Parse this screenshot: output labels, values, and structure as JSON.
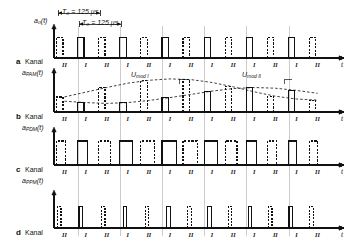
{
  "figure": {
    "time_axis_label": "t",
    "period_labels": [
      {
        "id": "T0",
        "text": "T₀ = 125 μs"
      },
      {
        "id": "T0b",
        "text": "T₀ = 125 μs"
      }
    ],
    "top_signal_label": "a₀(t)",
    "mod_labels": [
      {
        "id": "mod1",
        "text": "U",
        "sub": "mod I"
      },
      {
        "id": "mod2",
        "text": "U",
        "sub": "mod II"
      }
    ],
    "channels": [
      "I",
      "II"
    ],
    "rows": [
      {
        "letter": "a",
        "kanal": "Kanal",
        "signal": "a",
        "signal_sub": "PAM",
        "signal_arg": "(t)",
        "type": "clock",
        "description": "Abtastimpulse Kanal I und II"
      },
      {
        "letter": "b",
        "kanal": "Kanal",
        "signal": "a",
        "signal_sub": "PDM",
        "signal_arg": "(t)",
        "type": "pam",
        "description": "Pulsamplitudenmodulation"
      },
      {
        "letter": "c",
        "kanal": "Kanal",
        "signal": "a",
        "signal_sub": "PPM",
        "signal_arg": "(t)",
        "type": "pdm",
        "description": "Pulsdauermodulation"
      },
      {
        "letter": "d",
        "kanal": "Kanal",
        "signal": "a",
        "signal_sub": "PPM",
        "signal_arg": "(t)",
        "type": "ppm",
        "description": "Pulsphasenmodulation"
      }
    ],
    "channel_marks": [
      "II",
      "I",
      "II",
      "I",
      "II",
      "I",
      "II",
      "I",
      "II",
      "I",
      "II",
      "I",
      "II"
    ],
    "colors": {
      "ink": "#111111",
      "background": "#ffffff",
      "grid": "#9a9a9a"
    }
  },
  "chart_data": {
    "type": "line",
    "xlabel": "t",
    "ylabel": "",
    "x_unit": "μs",
    "sample_period_us": 125,
    "slot_count": 13,
    "series": [
      {
        "name": "a0(t) Abtastimpulse",
        "row": "a",
        "kind": "pulse-train",
        "pulse_amplitudes": [
          1,
          1,
          1,
          1,
          1,
          1,
          1,
          1,
          1,
          1,
          1,
          1,
          1
        ],
        "pulse_style": [
          "dashed",
          "solid",
          "dashed",
          "solid",
          "dashed",
          "solid",
          "dashed",
          "solid",
          "dashed",
          "solid",
          "dashed",
          "solid",
          "dashed"
        ]
      },
      {
        "name": "aPAM(t)",
        "row": "b",
        "kind": "pam",
        "envelope_I": [
          0.42,
          0.55,
          0.68,
          0.8,
          0.88,
          0.92,
          0.9,
          0.82,
          0.7,
          0.56,
          0.44,
          0.36,
          0.33
        ],
        "envelope_II": [
          0.3,
          0.26,
          0.24,
          0.26,
          0.32,
          0.4,
          0.49,
          0.58,
          0.65,
          0.68,
          0.66,
          0.6,
          0.52
        ],
        "amplitudes_I": [
          0.55,
          0.8,
          0.92,
          0.82,
          0.56,
          0.36
        ],
        "amplitudes_II": [
          0.42,
          0.68,
          0.88,
          0.9,
          0.7,
          0.44,
          0.33
        ]
      },
      {
        "name": "aPDM(t)",
        "row": "c",
        "kind": "pdm",
        "widths_I": [
          0.45,
          0.7,
          0.85,
          0.72,
          0.5,
          0.33
        ],
        "widths_II": [
          0.38,
          0.6,
          0.8,
          0.82,
          0.62,
          0.4,
          0.3
        ]
      },
      {
        "name": "aPPM(t)",
        "row": "d",
        "kind": "ppm",
        "offsets_I": [
          0.12,
          0.3,
          0.42,
          0.32,
          0.16,
          0.05
        ],
        "offsets_II": [
          0.08,
          0.24,
          0.38,
          0.4,
          0.26,
          0.1,
          0.03
        ]
      }
    ],
    "legend": [
      "Kanal I",
      "Kanal II"
    ],
    "grid": true
  }
}
